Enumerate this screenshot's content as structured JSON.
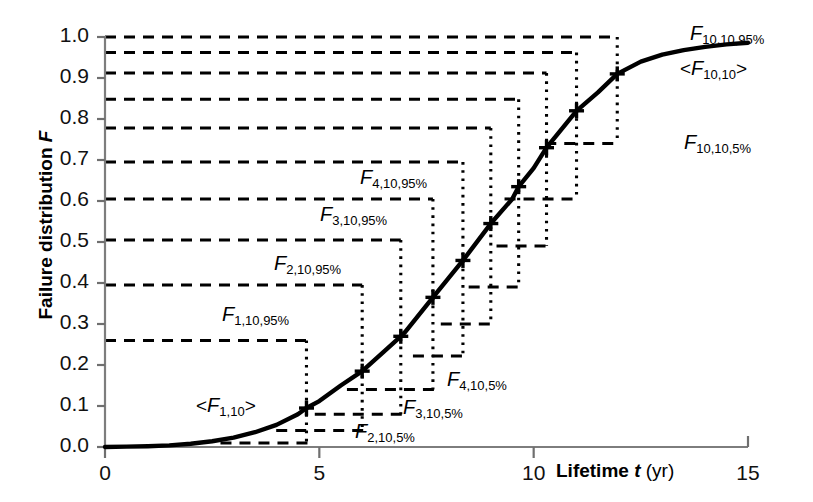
{
  "figure": {
    "y_axis_title": "Failure distribution F",
    "y_axis_title_italic": "F",
    "x_axis_title": "Lifetime t (yr)",
    "x_axis_title_main": "Lifetime",
    "x_axis_title_var": "t",
    "x_axis_title_unit": "(yr)"
  },
  "axes": {
    "y_ticks": [
      "0.0",
      "0.1",
      "0.2",
      "0.3",
      "0.4",
      "0.5",
      "0.6",
      "0.7",
      "0.8",
      "0.9",
      "1.0"
    ],
    "x_ticks": [
      "0",
      "5",
      "10",
      "15"
    ]
  },
  "annotations": [
    {
      "id": "f1_95",
      "text": "F 1,10,95%",
      "base": "F",
      "sub": "1,10,95%"
    },
    {
      "id": "f2_95",
      "text": "F 2,10,95%",
      "base": "F",
      "sub": "2,10,95%"
    },
    {
      "id": "f3_95",
      "text": "F 3,10,95%",
      "base": "F",
      "sub": "3,10,95%"
    },
    {
      "id": "f4_95",
      "text": "F 4,10,95%",
      "base": "F",
      "sub": "4,10,95%"
    },
    {
      "id": "f10_95",
      "text": "F 10,10,95%",
      "base": "F",
      "sub": "10,10,95%"
    },
    {
      "id": "f1_mean",
      "text": "<F 1,10>",
      "base": "F",
      "sub": "1,10"
    },
    {
      "id": "f10_mean",
      "text": "<F 10,10>",
      "base": "F",
      "sub": "10,10"
    },
    {
      "id": "f2_5",
      "text": "F 2,10,5%",
      "base": "F",
      "sub": "2,10,5%"
    },
    {
      "id": "f3_5",
      "text": "F 3,10,5%",
      "base": "F",
      "sub": "3,10,5%"
    },
    {
      "id": "f4_5",
      "text": "F 4,10,5%",
      "base": "F",
      "sub": "4,10,5%"
    },
    {
      "id": "f10_5",
      "text": "F 10,10,5%",
      "base": "F",
      "sub": "10,10,5%"
    }
  ],
  "chart_data": {
    "type": "line",
    "title": "",
    "xlabel": "Lifetime t (yr)",
    "ylabel": "Failure distribution F",
    "xlim": [
      0,
      15
    ],
    "ylim": [
      0.0,
      1.0
    ],
    "xticks": [
      0,
      5,
      10,
      15
    ],
    "yticks": [
      0.0,
      0.1,
      0.2,
      0.3,
      0.4,
      0.5,
      0.6,
      0.7,
      0.8,
      0.9,
      1.0
    ],
    "grid": false,
    "legend": "none",
    "series": [
      {
        "name": "Failure distribution F(t)",
        "comment": "smooth sigmoidal cumulative failure curve",
        "x": [
          0.0,
          0.5,
          1.0,
          1.5,
          2.0,
          2.5,
          3.0,
          3.5,
          4.0,
          4.5,
          4.7,
          5.0,
          5.5,
          6.0,
          6.5,
          6.9,
          7.0,
          7.65,
          8.0,
          8.35,
          9.0,
          9.5,
          9.65,
          10.0,
          10.3,
          11.0,
          11.5,
          11.95,
          12.5,
          13.0,
          13.5,
          14.0,
          14.5,
          15.0
        ],
        "y": [
          0.0,
          0.001,
          0.002,
          0.004,
          0.008,
          0.014,
          0.023,
          0.036,
          0.054,
          0.08,
          0.095,
          0.112,
          0.15,
          0.185,
          0.232,
          0.27,
          0.28,
          0.365,
          0.41,
          0.455,
          0.545,
          0.605,
          0.635,
          0.68,
          0.73,
          0.82,
          0.865,
          0.91,
          0.94,
          0.957,
          0.968,
          0.976,
          0.982,
          0.986
        ]
      }
    ],
    "markers": [
      {
        "label": "<F_1,10>",
        "index": 1,
        "x": 4.7,
        "y": 0.095,
        "upper_95": 0.26,
        "lower_5": 0.01
      },
      {
        "label": "<F_2,10>",
        "index": 2,
        "x": 6.0,
        "y": 0.185,
        "upper_95": 0.395,
        "lower_5": 0.04
      },
      {
        "label": "<F_3,10>",
        "index": 3,
        "x": 6.9,
        "y": 0.27,
        "upper_95": 0.505,
        "lower_5": 0.08
      },
      {
        "label": "<F_4,10>",
        "index": 4,
        "x": 7.65,
        "y": 0.365,
        "upper_95": 0.605,
        "lower_5": 0.14
      },
      {
        "label": "<F_5,10>",
        "index": 5,
        "x": 8.35,
        "y": 0.455,
        "upper_95": 0.695,
        "lower_5": 0.222
      },
      {
        "label": "<F_6,10>",
        "index": 6,
        "x": 9.0,
        "y": 0.545,
        "upper_95": 0.778,
        "lower_5": 0.3
      },
      {
        "label": "<F_7,10>",
        "index": 7,
        "x": 9.65,
        "y": 0.635,
        "upper_95": 0.848,
        "lower_5": 0.39
      },
      {
        "label": "<F_8,10>",
        "index": 8,
        "x": 10.3,
        "y": 0.73,
        "upper_95": 0.912,
        "lower_5": 0.49
      },
      {
        "label": "<F_9,10>",
        "index": 9,
        "x": 11.0,
        "y": 0.82,
        "upper_95": 0.962,
        "lower_5": 0.605
      },
      {
        "label": "<F_10,10>",
        "index": 10,
        "x": 11.95,
        "y": 0.91,
        "upper_95": 1.0,
        "lower_5": 0.74
      }
    ]
  }
}
